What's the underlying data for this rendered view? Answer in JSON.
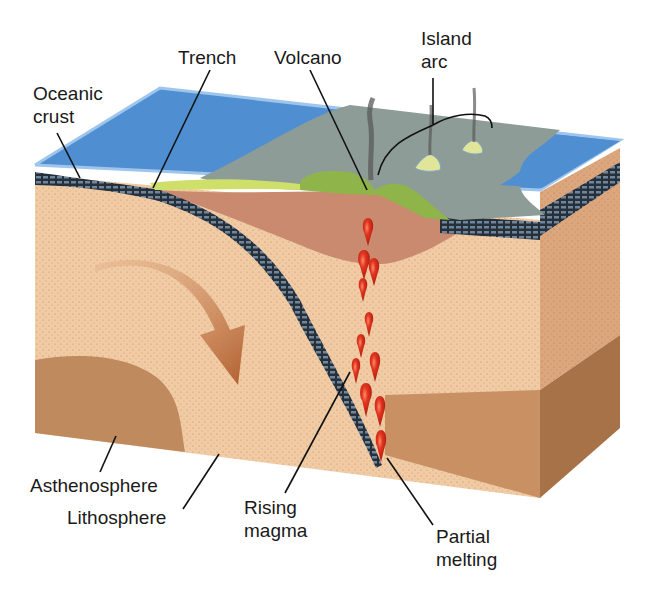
{
  "labels": {
    "oceanic_crust": "Oceanic\ncrust",
    "trench": "Trench",
    "volcano": "Volcano",
    "island_arc": "Island\narc",
    "asthenosphere": "Asthenosphere",
    "lithosphere": "Lithosphere",
    "rising_magma": "Rising\nmagma",
    "partial_melting": "Partial\nmelting"
  },
  "colors": {
    "ocean": "#4f8fd1",
    "ocean_edge": "#8fbbe6",
    "shallow_sea": "#8f9f98",
    "island_green": "#8fb54a",
    "island_yellow": "#d6e06a",
    "oceanic_crust": "#2b3440",
    "crust_grid": "#7f97ad",
    "lithosphere": "#f0c9a0",
    "lithosphere_side": "#d9a37a",
    "mantle_wedge": "#c98a6a",
    "asthenosphere": "#c0895e",
    "asthenosphere_side": "#a97349",
    "magma": "#d42a1c",
    "arrow": "#b8683e",
    "smoke": "#555555",
    "leader_line": "#111111"
  }
}
